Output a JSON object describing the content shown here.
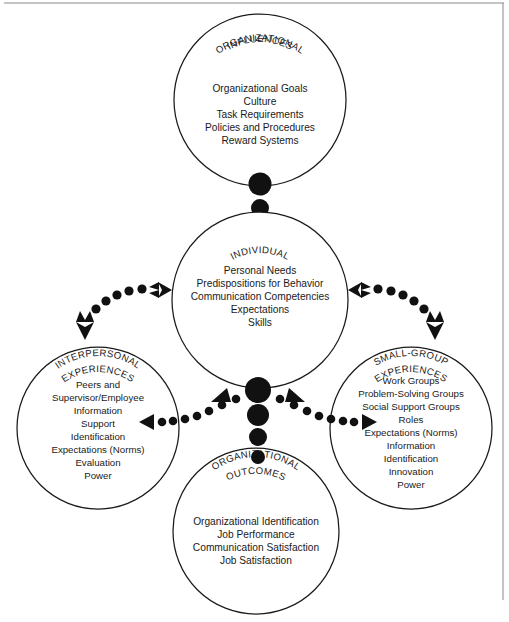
{
  "figure": {
    "background_color": "#ffffff",
    "ink_color": "#1a1a1a",
    "frame_color": "#8a8a8a"
  },
  "nodes": {
    "organizational_influences": {
      "label_line1": "ORGANIZATIONAL",
      "label_line2": "INFLUENCES",
      "items": [
        "Organizational Goals",
        "Culture",
        "Task Requirements",
        "Policies and Procedures",
        "Reward Systems"
      ]
    },
    "individual": {
      "label_line1": "INDIVIDUAL",
      "label_line2": "",
      "items": [
        "Personal Needs",
        "Predispositions for Behavior",
        "Communication Competencies",
        "Expectations",
        "Skills"
      ]
    },
    "interpersonal_experiences": {
      "label_line1": "INTERPERSONAL",
      "label_line2": "EXPERIENCES",
      "items": [
        "Peers and",
        "Supervisor/Employee",
        "Information",
        "Support",
        "Identification",
        "Expectations (Norms)",
        "Evaluation",
        "Power"
      ]
    },
    "small_group_experiences": {
      "label_line1": "SMALL-GROUP",
      "label_line2": "EXPERIENCES",
      "items": [
        "Work Groups",
        "Problem-Solving Groups",
        "Social Support Groups",
        "Roles",
        "Expectations (Norms)",
        "Information",
        "Identification",
        "Innovation",
        "Power"
      ]
    },
    "organizational_outcomes": {
      "label_line1": "ORGANIZATIONAL",
      "label_line2": "OUTCOMES",
      "items": [
        "Organizational Identification",
        "Job Performance",
        "Communication Satisfaction",
        "Job Satisfaction"
      ]
    }
  },
  "connectors": {
    "influences_to_individual": "vertical-dot-link",
    "individual_to_interpersonal": "dotted-double-arrow",
    "individual_to_small_group": "dotted-double-arrow",
    "hub_to_interpersonal": "dotted-arrow-left",
    "hub_to_small_group": "dotted-arrow-right",
    "hub_to_outcomes": "vertical-dot-link"
  }
}
